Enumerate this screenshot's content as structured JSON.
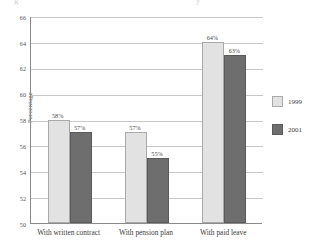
{
  "chart_data": {
    "type": "bar",
    "title": "",
    "xlabel": "",
    "ylabel": "Percentage",
    "ylim": [
      50,
      66
    ],
    "ytick_step": 2,
    "yticks": [
      "66",
      "64",
      "62",
      "60",
      "58",
      "56",
      "54",
      "52",
      "50"
    ],
    "grid": true,
    "legend_position": "right",
    "categories": [
      "With written contract",
      "With pension plan",
      "With paid leave"
    ],
    "series": [
      {
        "name": "1999",
        "color": "#e2e2e2",
        "values": [
          58,
          57,
          64
        ],
        "labels": [
          "58%",
          "57%",
          "64%"
        ]
      },
      {
        "name": "2001",
        "color": "#6e6e6e",
        "values": [
          57,
          55,
          63
        ],
        "labels": [
          "57%",
          "55%",
          "63%"
        ]
      }
    ]
  },
  "cutoff_text": {
    "left": "g",
    "right": "y"
  }
}
